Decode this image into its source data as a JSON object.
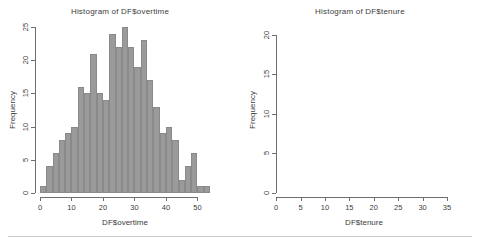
{
  "page": {
    "background_color": "#ffffff",
    "divider_color": "#c9c9c9"
  },
  "panels": [
    {
      "id": "overtime",
      "title": "Histogram of DF$overtime",
      "xlabel": "DF$overtime",
      "ylabel": "Frequency",
      "bar_color": "#9a9a9a",
      "x_ticks": [
        "0",
        "10",
        "20",
        "30",
        "40",
        "50"
      ],
      "y_ticks": [
        "0",
        "5",
        "10",
        "15",
        "20",
        "25"
      ]
    },
    {
      "id": "tenure",
      "title": "Histogram of DF$tenure",
      "xlabel": "DF$tenure",
      "ylabel": "Frequency",
      "bar_color": "#656565",
      "x_ticks": [
        "0",
        "5",
        "10",
        "15",
        "20",
        "25",
        "30",
        "35"
      ],
      "y_ticks": [
        "0",
        "5",
        "10",
        "15",
        "20"
      ]
    }
  ],
  "chart_data": [
    {
      "type": "bar",
      "id": "overtime",
      "title": "Histogram of DF$overtime",
      "xlabel": "DF$overtime",
      "ylabel": "Frequency",
      "subtitle": "",
      "grid": false,
      "legend": "none",
      "bin_width": 2,
      "xlim": [
        0,
        54
      ],
      "ylim": [
        0,
        25
      ],
      "x_ticks": [
        0,
        10,
        20,
        30,
        40,
        50
      ],
      "y_ticks": [
        0,
        5,
        10,
        15,
        20,
        25
      ],
      "bin_starts": [
        0,
        2,
        4,
        6,
        8,
        10,
        12,
        14,
        16,
        18,
        20,
        22,
        24,
        26,
        28,
        30,
        32,
        34,
        36,
        38,
        40,
        42,
        44,
        46,
        48,
        50,
        52
      ],
      "categories": [
        "0-2",
        "2-4",
        "4-6",
        "6-8",
        "8-10",
        "10-12",
        "12-14",
        "14-16",
        "16-18",
        "18-20",
        "20-22",
        "22-24",
        "24-26",
        "26-28",
        "28-30",
        "30-32",
        "32-34",
        "34-36",
        "36-38",
        "38-40",
        "40-42",
        "42-44",
        "44-46",
        "46-48",
        "48-50",
        "50-52",
        "52-54"
      ],
      "values": [
        1,
        4,
        6,
        8,
        9,
        10,
        16,
        15,
        21,
        15,
        14,
        24,
        22,
        25,
        22,
        19,
        23,
        17,
        13,
        9,
        10,
        8,
        2,
        4,
        6,
        1,
        1
      ]
    },
    {
      "type": "bar",
      "id": "tenure",
      "title": "Histogram of DF$tenure",
      "xlabel": "DF$tenure",
      "ylabel": "Frequency",
      "subtitle": "",
      "grid": false,
      "legend": "none",
      "bin_width": 1,
      "xlim": [
        1,
        35
      ],
      "ylim": [
        0,
        21
      ],
      "x_ticks": [
        0,
        5,
        10,
        15,
        20,
        25,
        30,
        35
      ],
      "y_ticks": [
        0,
        5,
        10,
        15,
        20
      ],
      "bin_starts": [
        1,
        2,
        3,
        4,
        5,
        6,
        7,
        8,
        9,
        10,
        11,
        12,
        13,
        14,
        15,
        16,
        17,
        18,
        19,
        20,
        21,
        22,
        23,
        24,
        25,
        26,
        27,
        28,
        29,
        30,
        31,
        32,
        33,
        34
      ],
      "categories": [
        "1-2",
        "2-3",
        "3-4",
        "4-5",
        "5-6",
        "6-7",
        "7-8",
        "8-9",
        "9-10",
        "10-11",
        "11-12",
        "12-13",
        "13-14",
        "14-15",
        "15-16",
        "16-17",
        "17-18",
        "18-19",
        "19-20",
        "20-21",
        "21-22",
        "22-23",
        "23-24",
        "24-25",
        "25-26",
        "26-27",
        "27-28",
        "28-29",
        "29-30",
        "30-31",
        "31-32",
        "32-33",
        "33-34",
        "34-35"
      ],
      "values": [
        11,
        14,
        7,
        17,
        13,
        13,
        12,
        14,
        12,
        18,
        21,
        12,
        13,
        17,
        14,
        9,
        12,
        9,
        10,
        4,
        6,
        5,
        6,
        9,
        6,
        7,
        6,
        7,
        11,
        0,
        3,
        4,
        2,
        1
      ]
    }
  ]
}
